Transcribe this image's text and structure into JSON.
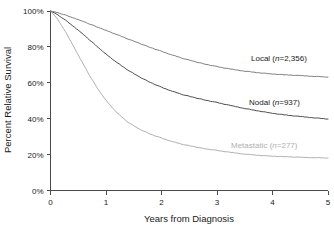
{
  "chart_data": {
    "type": "line",
    "title": "",
    "xlabel": "Years from Diagnosis",
    "ylabel": "Percent Relative Survival",
    "xlim": [
      0,
      5
    ],
    "ylim": [
      0,
      100
    ],
    "grid": false,
    "legend_position": "inline-right-of-curves",
    "x_ticks": [
      "0",
      "1",
      "2",
      "3",
      "4",
      "5"
    ],
    "x_tick_values": [
      0,
      1,
      2,
      3,
      4,
      5
    ],
    "y_ticks": [
      "0%",
      "20%",
      "40%",
      "60%",
      "80%",
      "100%"
    ],
    "y_tick_values": [
      0,
      20,
      40,
      60,
      80,
      100
    ],
    "x": [
      0,
      0.1,
      0.2,
      0.3,
      0.4,
      0.5,
      0.6,
      0.7,
      0.8,
      0.9,
      1.0,
      1.2,
      1.4,
      1.6,
      1.8,
      2.0,
      2.2,
      2.4,
      2.6,
      2.8,
      3.0,
      3.25,
      3.5,
      3.75,
      4.0,
      4.25,
      4.5,
      4.75,
      5.0
    ],
    "series": [
      {
        "name": "Local",
        "n": 2356,
        "label": "Local (n=2,356)",
        "color": "#808080",
        "values": [
          100,
          99.3,
          98.4,
          97.4,
          96.3,
          95.2,
          94.0,
          92.8,
          91.6,
          90.4,
          89.2,
          86.8,
          84.4,
          82.0,
          79.7,
          77.5,
          75.4,
          73.5,
          71.8,
          70.3,
          69.0,
          67.6,
          66.5,
          65.6,
          64.9,
          64.4,
          64.0,
          63.6,
          63.2
        ]
      },
      {
        "name": "Nodal",
        "n": 937,
        "label": "Nodal (n=937)",
        "color": "#4d4d4d",
        "values": [
          100,
          98.4,
          96.4,
          94.2,
          91.8,
          89.3,
          86.7,
          84.0,
          81.3,
          78.6,
          76.0,
          71.2,
          67.0,
          63.3,
          60.2,
          57.5,
          55.2,
          53.3,
          51.7,
          50.3,
          49.0,
          47.3,
          45.7,
          44.3,
          43.0,
          42.0,
          41.2,
          40.5,
          39.8
        ]
      },
      {
        "name": "Metastatic",
        "n": 277,
        "label": "Metastatic (n=277)",
        "color": "#b0b0b0",
        "values": [
          100,
          96.5,
          92.0,
          86.8,
          81.2,
          75.5,
          69.8,
          64.3,
          59.2,
          54.5,
          50.2,
          43.2,
          38.0,
          34.2,
          31.4,
          29.2,
          27.2,
          25.6,
          24.3,
          23.2,
          22.3,
          21.2,
          20.3,
          19.6,
          19.1,
          18.8,
          18.5,
          18.3,
          18.1
        ]
      }
    ]
  },
  "labels": {
    "local": "Local (n=2,356)",
    "local_prefix": "Local (",
    "local_italic": "n",
    "local_suffix": "=2,356)",
    "nodal_prefix": "Nodal (",
    "nodal_italic": "n",
    "nodal_suffix": "=937)",
    "metastatic_prefix": "Metastatic (",
    "metastatic_italic": "n",
    "metastatic_suffix": "=277)"
  }
}
